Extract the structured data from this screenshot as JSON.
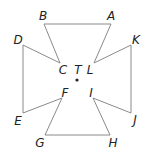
{
  "diagram": {
    "type": "geometric-figure",
    "colors": {
      "line": "#8a8a8a",
      "label": "#222222",
      "background": "#ffffff"
    },
    "points": [
      {
        "id": "A",
        "label": "A",
        "x": 111,
        "y": 24,
        "lx": 111,
        "ly": 16
      },
      {
        "id": "B",
        "label": "B",
        "x": 44,
        "y": 24,
        "lx": 43,
        "ly": 16
      },
      {
        "id": "C",
        "label": "C",
        "x": 60,
        "y": 63,
        "lx": 63,
        "ly": 70
      },
      {
        "id": "D",
        "label": "D",
        "x": 23,
        "y": 45,
        "lx": 18,
        "ly": 40
      },
      {
        "id": "E",
        "label": "E",
        "x": 23,
        "y": 113,
        "lx": 18,
        "ly": 121
      },
      {
        "id": "F",
        "label": "F",
        "x": 62,
        "y": 98,
        "lx": 65,
        "ly": 93
      },
      {
        "id": "G",
        "label": "G",
        "x": 45,
        "y": 135,
        "lx": 40,
        "ly": 143
      },
      {
        "id": "H",
        "label": "H",
        "x": 110,
        "y": 135,
        "lx": 113,
        "ly": 143
      },
      {
        "id": "I",
        "label": "I",
        "x": 93,
        "y": 98,
        "lx": 91,
        "ly": 93
      },
      {
        "id": "J",
        "label": "J",
        "x": 131,
        "y": 113,
        "lx": 135,
        "ly": 120
      },
      {
        "id": "K",
        "label": "K",
        "x": 131,
        "y": 45,
        "lx": 136,
        "ly": 40
      },
      {
        "id": "L",
        "label": "L",
        "x": 94,
        "y": 63,
        "lx": 90,
        "ly": 70
      }
    ],
    "center": {
      "id": "T",
      "label": "T",
      "x": 77,
      "y": 80,
      "lx": 78,
      "ly": 70
    },
    "edges": [
      [
        "B",
        "A"
      ],
      [
        "A",
        "L"
      ],
      [
        "B",
        "C"
      ],
      [
        "D",
        "C"
      ],
      [
        "D",
        "E"
      ],
      [
        "E",
        "F"
      ],
      [
        "F",
        "G"
      ],
      [
        "G",
        "H"
      ],
      [
        "H",
        "I"
      ],
      [
        "I",
        "J"
      ],
      [
        "J",
        "K"
      ],
      [
        "K",
        "L"
      ]
    ]
  }
}
